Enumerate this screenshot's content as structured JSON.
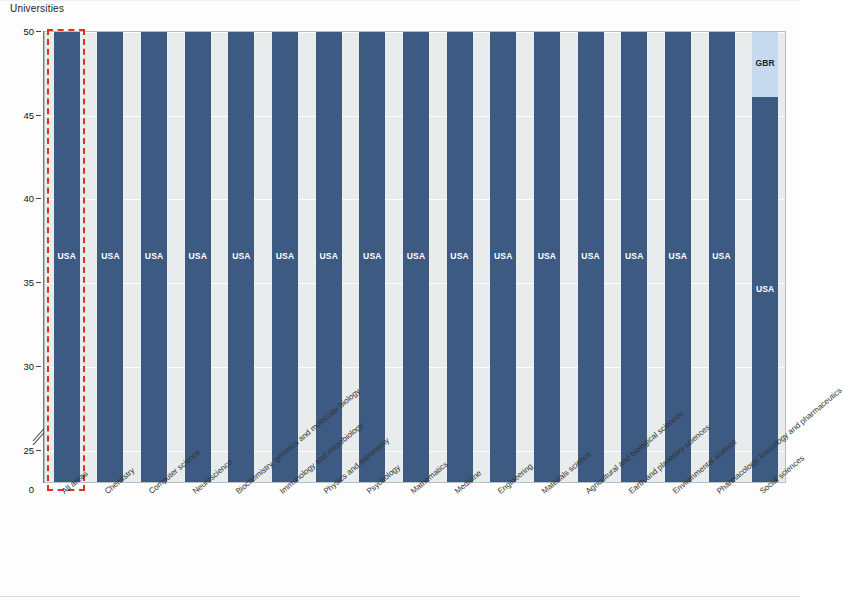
{
  "axis": {
    "y_title": "Universities",
    "y_ticks": [
      "50",
      "45",
      "40",
      "35",
      "30",
      "25",
      "0"
    ],
    "y_break": true
  },
  "colors": {
    "plot_background": "#e9ecec",
    "grid": "#ffffff",
    "highlight_outline": "#e03020",
    "USA": "#3d5a82",
    "GBR": "#c6d9ee",
    "NLD": "#f2f5f7",
    "FRA": "#8a5f95",
    "CHE": "#3b7a82",
    "ITA": "#5fa3c4",
    "CAN": "#a9bedb",
    "DEU": "#d5e6f2",
    "BEL": "#76a545",
    "SWE": "#f6c97a",
    "DNK": "#b3aecd",
    "HKG": "#a8cf5a",
    "IRL": "#dfe9ee",
    "ESP": "#9e2a20",
    "ISR": "#ef9b35",
    "AUT": "#2b62b0",
    "AUS": "#16316b",
    "JPN": "#d9462c",
    "CHN": "#d5e8a8",
    "ZAF": "#c8c08a",
    "TWN": "#cfe4ea",
    "KOR": "#9e95c4",
    "IND": "#c5dd8c",
    "BRA": "#c2523a"
  },
  "highlight": {
    "column_index": 0,
    "label": "All areas"
  },
  "chart_data": {
    "type": "bar",
    "title": "",
    "subtitle": "",
    "xlabel": "",
    "ylabel": "Universities",
    "ylim": [
      23,
      50
    ],
    "ytick_values": [
      25,
      30,
      35,
      40,
      45,
      50
    ],
    "grid": true,
    "legend": "none",
    "stacked": true,
    "note": "Stacked bar chart: number of universities in the top 100 by country, per subject area. Axis has a break between 0 and 25.",
    "categories": [
      "All areas",
      "Chemistry",
      "Computer science",
      "Neuroscience",
      "Biochemistry, genetics and molecular biology",
      "Immunology and microbiology",
      "Physics and astronomy",
      "Psychology",
      "Mathematics",
      "Medicine",
      "Engineering",
      "Materials science",
      "Agricultural and biological sciences",
      "Earth and planetary sciences",
      "Environmental science",
      "Pharmacology, toxicology and pharmaceutics",
      "Social sciences"
    ],
    "columns": [
      {
        "category": "All areas",
        "total": 50,
        "segments": [
          {
            "code": "USA",
            "value": 40
          },
          {
            "code": "GBR",
            "value": 6
          },
          {
            "code": "FRA",
            "value": 2
          },
          {
            "code": "NLD",
            "value": 1
          },
          {
            "code": "CHE",
            "value": 0.7
          },
          {
            "code": "ITA",
            "value": 0.7
          }
        ]
      },
      {
        "category": "Chemistry",
        "total": 50,
        "segments": [
          {
            "code": "USA",
            "value": 39
          },
          {
            "code": "GBR",
            "value": 3
          },
          {
            "code": "NLD",
            "value": 2.5
          },
          {
            "code": "CHE",
            "value": 2
          },
          {
            "code": "ITA",
            "value": 1
          },
          {
            "code": "DEU",
            "value": 1
          },
          {
            "code": "HKG",
            "value": 0.8
          },
          {
            "code": "IRL",
            "value": 0.8
          },
          {
            "code": "ESP",
            "value": 0.8
          }
        ]
      },
      {
        "category": "Computer science",
        "total": 50,
        "segments": [
          {
            "code": "USA",
            "value": 39
          },
          {
            "code": "GBR",
            "value": 3
          },
          {
            "code": "CHE",
            "value": 2
          },
          {
            "code": "CAN",
            "value": 2
          },
          {
            "code": "BEL",
            "value": 0.9
          },
          {
            "code": "SWE",
            "value": 0.9
          },
          {
            "code": "HKG",
            "value": 0.9
          },
          {
            "code": "AUT",
            "value": 0.9
          },
          {
            "code": "ISR",
            "value": 0.9
          }
        ]
      },
      {
        "category": "Neuroscience",
        "total": 50,
        "segments": [
          {
            "code": "USA",
            "value": 37
          },
          {
            "code": "GBR",
            "value": 5
          },
          {
            "code": "NLD",
            "value": 2
          },
          {
            "code": "CHE",
            "value": 1.5
          },
          {
            "code": "CAN",
            "value": 2
          },
          {
            "code": "DEU",
            "value": 1.5
          }
        ]
      },
      {
        "category": "Biochemistry, genetics and molecular biology",
        "total": 50,
        "segments": [
          {
            "code": "USA",
            "value": 35
          },
          {
            "code": "GBR",
            "value": 5
          },
          {
            "code": "NLD",
            "value": 2
          },
          {
            "code": "CHE",
            "value": 5
          },
          {
            "code": "IRL",
            "value": 1
          }
        ]
      },
      {
        "category": "Immunology and microbiology",
        "total": 50,
        "segments": [
          {
            "code": "USA",
            "value": 35
          },
          {
            "code": "GBR",
            "value": 3
          },
          {
            "code": "NLD",
            "value": 1.5
          },
          {
            "code": "CHE",
            "value": 2
          },
          {
            "code": "CAN",
            "value": 2
          },
          {
            "code": "DEU",
            "value": 2
          },
          {
            "code": "AUS",
            "value": 1.5
          },
          {
            "code": "DNK",
            "value": 0.9
          },
          {
            "code": "JPN",
            "value": 0.9
          },
          {
            "code": "ZAF",
            "value": 0.9
          }
        ]
      },
      {
        "category": "Physics and astronomy",
        "total": 50,
        "segments": [
          {
            "code": "USA",
            "value": 34
          },
          {
            "code": "GBR",
            "value": 2
          },
          {
            "code": "FRA",
            "value": 3
          },
          {
            "code": "NLD",
            "value": 1
          },
          {
            "code": "CHE",
            "value": 2
          },
          {
            "code": "DEU",
            "value": 4
          },
          {
            "code": "AUT",
            "value": 1
          },
          {
            "code": "ISR",
            "value": 1.2
          }
        ]
      },
      {
        "category": "Psychology",
        "total": 50,
        "segments": [
          {
            "code": "USA",
            "value": 35
          },
          {
            "code": "GBR",
            "value": 6
          },
          {
            "code": "NLD",
            "value": 5
          },
          {
            "code": "CAN",
            "value": 2.5
          },
          {
            "code": "BEL",
            "value": 1.1
          }
        ]
      },
      {
        "category": "Mathematics",
        "total": 50,
        "segments": [
          {
            "code": "USA",
            "value": 34
          },
          {
            "code": "GBR",
            "value": 3
          },
          {
            "code": "NLD",
            "value": 1
          },
          {
            "code": "CHE",
            "value": 1.5
          },
          {
            "code": "BEL",
            "value": 3
          },
          {
            "code": "CHN",
            "value": 1
          },
          {
            "code": "DNK",
            "value": 0.9
          },
          {
            "code": "AUT",
            "value": 1.2
          },
          {
            "code": "ISR",
            "value": 1
          },
          {
            "code": "ESP",
            "value": 1
          },
          {
            "code": "TWN",
            "value": 1.2
          }
        ]
      },
      {
        "category": "Medicine",
        "total": 50,
        "segments": [
          {
            "code": "USA",
            "value": 34
          },
          {
            "code": "GBR",
            "value": 7
          },
          {
            "code": "NLD",
            "value": 2.5
          },
          {
            "code": "CHE",
            "value": 1.6
          },
          {
            "code": "CAN",
            "value": 1.6
          },
          {
            "code": "BEL",
            "value": 0.9
          },
          {
            "code": "SWE",
            "value": 0.9
          },
          {
            "code": "DNK",
            "value": 0.9
          },
          {
            "code": "HKG",
            "value": 0.9
          },
          {
            "code": "IRL",
            "value": 0.9
          }
        ]
      },
      {
        "category": "Engineering",
        "total": 50,
        "segments": [
          {
            "code": "USA",
            "value": 33
          },
          {
            "code": "GBR",
            "value": 4
          },
          {
            "code": "NLD",
            "value": 2
          },
          {
            "code": "CHE",
            "value": 1.5
          },
          {
            "code": "CAN",
            "value": 2
          },
          {
            "code": "AUS",
            "value": 3
          },
          {
            "code": "CHN",
            "value": 1.5
          },
          {
            "code": "SWE",
            "value": 1
          },
          {
            "code": "DNK",
            "value": 1
          },
          {
            "code": "JPN",
            "value": 1
          }
        ]
      },
      {
        "category": "Materials science",
        "total": 50,
        "segments": [
          {
            "code": "USA",
            "value": 32
          },
          {
            "code": "GBR",
            "value": 7
          },
          {
            "code": "FRA",
            "value": 1.5
          },
          {
            "code": "NLD",
            "value": 1.5
          },
          {
            "code": "CHE",
            "value": 3
          },
          {
            "code": "DEU",
            "value": 1.5
          },
          {
            "code": "SWE",
            "value": 1.2
          }
        ]
      },
      {
        "category": "Agricultural and biological sciences",
        "total": 50,
        "segments": [
          {
            "code": "USA",
            "value": 27
          },
          {
            "code": "GBR",
            "value": 8
          },
          {
            "code": "NLD",
            "value": 2
          },
          {
            "code": "CHE",
            "value": 4
          },
          {
            "code": "DEU",
            "value": 1.5
          },
          {
            "code": "SWE",
            "value": 1.2
          }
        ]
      },
      {
        "category": "Earth and planetary sciences",
        "total": 50,
        "segments": [
          {
            "code": "USA",
            "value": 27
          },
          {
            "code": "GBR",
            "value": 6
          },
          {
            "code": "FRA",
            "value": 1
          },
          {
            "code": "NLD",
            "value": 1.5
          },
          {
            "code": "CHE",
            "value": 3
          },
          {
            "code": "CAN",
            "value": 3.5
          },
          {
            "code": "AUS",
            "value": 2
          },
          {
            "code": "SWE",
            "value": 0.9
          },
          {
            "code": "JPN",
            "value": 0.9
          }
        ]
      },
      {
        "category": "Environmental science",
        "total": 50,
        "segments": [
          {
            "code": "USA",
            "value": 27
          },
          {
            "code": "GBR",
            "value": 7
          },
          {
            "code": "NLD",
            "value": 2
          },
          {
            "code": "CHE",
            "value": 2
          },
          {
            "code": "CAN",
            "value": 1.5
          },
          {
            "code": "DEU",
            "value": 1.5
          },
          {
            "code": "BEL",
            "value": 1.5
          },
          {
            "code": "AUS",
            "value": 1
          },
          {
            "code": "SWE",
            "value": 0.9
          },
          {
            "code": "DNK",
            "value": 0.9
          }
        ]
      },
      {
        "category": "Pharmacology, toxicology and pharmaceutics",
        "total": 50,
        "segments": [
          {
            "code": "USA",
            "value": 27
          },
          {
            "code": "GBR",
            "value": 1.5
          },
          {
            "code": "NLD",
            "value": 1.5
          },
          {
            "code": "ITA",
            "value": 2
          },
          {
            "code": "CAN",
            "value": 2
          },
          {
            "code": "BEL",
            "value": 1
          },
          {
            "code": "AUS",
            "value": 1
          },
          {
            "code": "CHN",
            "value": 6
          },
          {
            "code": "JPN",
            "value": 3
          },
          {
            "code": "BRA",
            "value": 1
          },
          {
            "code": "IND",
            "value": 1
          },
          {
            "code": "KOR",
            "value": 1
          }
        ]
      },
      {
        "category": "Social sciences",
        "total": 50,
        "segments": [
          {
            "code": "USA",
            "value": 23
          },
          {
            "code": "GBR",
            "value": 16
          },
          {
            "code": "NLD",
            "value": 5
          },
          {
            "code": "CHE",
            "value": 1.2
          },
          {
            "code": "CAN",
            "value": 1.2
          },
          {
            "code": "BEL",
            "value": 1.2
          },
          {
            "code": "SWE",
            "value": 1.2
          },
          {
            "code": "HKG",
            "value": 1.2
          }
        ]
      }
    ]
  }
}
